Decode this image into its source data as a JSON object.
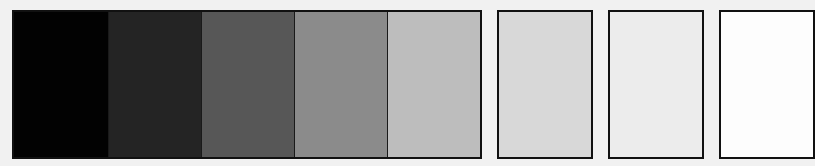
{
  "swatches": [
    {
      "index": 1,
      "color": "#020202",
      "grouped": true
    },
    {
      "index": 2,
      "color": "#242424",
      "grouped": true
    },
    {
      "index": 3,
      "color": "#575757",
      "grouped": true
    },
    {
      "index": 4,
      "color": "#8b8b8b",
      "grouped": true
    },
    {
      "index": 5,
      "color": "#bdbdbd",
      "grouped": true
    },
    {
      "index": 6,
      "color": "#d8d8d8",
      "grouped": false
    },
    {
      "index": 7,
      "color": "#ececec",
      "grouped": false
    },
    {
      "index": 8,
      "color": "#fdfdfd",
      "grouped": false
    }
  ],
  "background": "#f1f1f1",
  "border_color": "#111111"
}
